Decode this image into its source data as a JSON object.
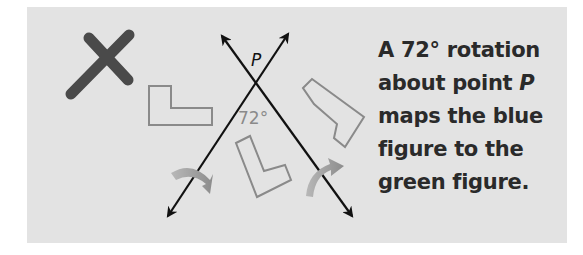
{
  "figure": {
    "point_label": "P",
    "angle_label": "72°",
    "mark": "x-mark",
    "colors": {
      "panel": "#e3e3e3",
      "lines": "#111111",
      "x_mark": "#4a4a4a",
      "shape_outline": "#8a8a8a",
      "angle_text": "#8a8a8a",
      "curved_arrow": "#9a9a9a"
    }
  },
  "caption": {
    "lines": [
      "A 72° rotation",
      "about point ",
      "maps the blue",
      "figure to the",
      "green figure."
    ],
    "point_var": "P"
  }
}
